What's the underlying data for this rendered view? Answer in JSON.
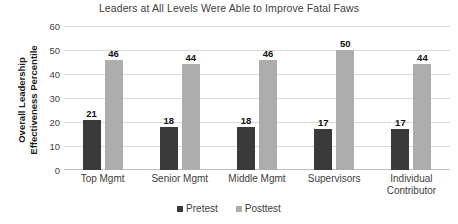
{
  "chart_data": {
    "type": "bar",
    "title": "Leaders at All Levels Were Able to Improve Fatal Faws",
    "xlabel": "",
    "ylabel": "Overall Leadership Effectiveness Percentile",
    "ylabel_line1": "Overall Leadership",
    "ylabel_line2": "Effectiveness Percentile",
    "categories": [
      "Top Mgmt",
      "Senior Mgmt",
      "Middle Mgmt",
      "Supervisors",
      "Individual Contributor"
    ],
    "category_lines": [
      [
        "Top Mgmt"
      ],
      [
        "Senior Mgmt"
      ],
      [
        "Middle Mgmt"
      ],
      [
        "Supervisors"
      ],
      [
        "Individual",
        "Contributor"
      ]
    ],
    "series": [
      {
        "name": "Pretest",
        "color": "#3a3a3a",
        "values": [
          21,
          18,
          18,
          17,
          17
        ]
      },
      {
        "name": "Posttest",
        "color": "#adadad",
        "values": [
          46,
          44,
          46,
          50,
          44
        ]
      }
    ],
    "ylim": [
      0,
      60
    ],
    "yticks": [
      0,
      10,
      20,
      30,
      40,
      50,
      60
    ],
    "ytick_labels": [
      "0",
      "10",
      "20",
      "30",
      "40",
      "50",
      "60"
    ],
    "grid": true,
    "grid_color": "#d9d9d9",
    "legend_position": "bottom",
    "data_labels": true
  }
}
